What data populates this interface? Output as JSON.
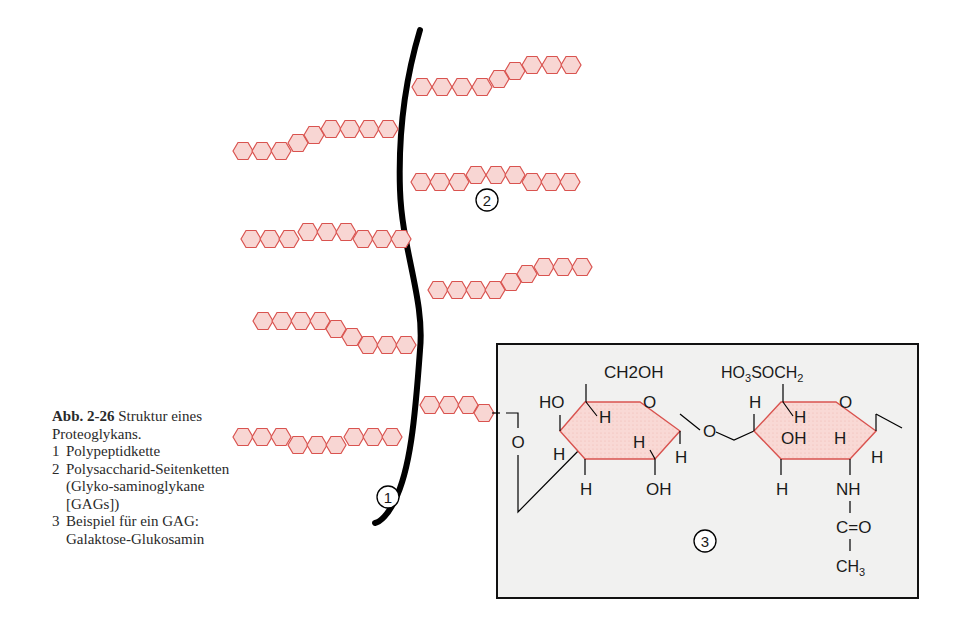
{
  "caption": {
    "figure_number": "Abb. 2-26",
    "title": "Struktur eines Proteoglykans.",
    "items": [
      {
        "num": "1",
        "text": "Polypeptidkette"
      },
      {
        "num": "2",
        "text": "Polysaccharid-Seitenketten (Glyko-saminoglykane [GAGs])"
      },
      {
        "num": "3",
        "text": "Beispiel für ein GAG: Galaktose-Glukosamin"
      }
    ]
  },
  "labels": {
    "marker_1": "1",
    "marker_2": "2",
    "marker_3": "3"
  },
  "structure": {
    "ring1_top": "CH2OH",
    "ring1_ho": "HO",
    "ring1_ring_o": "O",
    "ring1_h_inner": "H",
    "ring1_h_left": "H",
    "ring1_h_inner2": "H",
    "ring1_h_right": "H",
    "ring1_h_bottom": "H",
    "ring1_oh_bottom": "OH",
    "bridge_o": "O",
    "left_o": "O",
    "ring2_top": "HO3SOCH2",
    "ring2_h_top": "H",
    "ring2_h_inner": "H",
    "ring2_ring_o": "O",
    "ring2_oh_inner": "OH",
    "ring2_h_inner2": "H",
    "ring2_h_right": "H",
    "ring2_h_bottom": "H",
    "ring2_nh": "NH",
    "ring2_co": "C=O",
    "ring2_ch3": "CH3"
  },
  "colors": {
    "chain_stroke": "#d9534f",
    "chain_fill": "#f8d6d3",
    "backbone": "#000000",
    "box_fill": "#f1f1f0"
  }
}
